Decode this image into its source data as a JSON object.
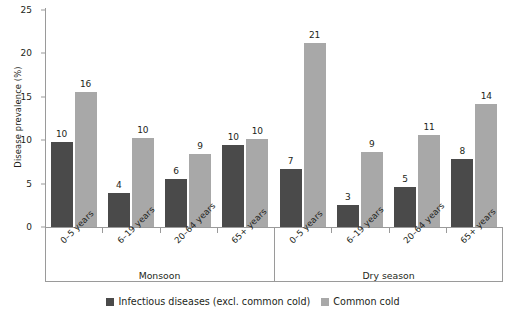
{
  "chart_data": {
    "type": "bar",
    "title": "",
    "xlabel": "",
    "ylabel": "Disease prevalence (%)",
    "ylim": [
      0,
      25
    ],
    "yticks": [
      0,
      5,
      10,
      15,
      20,
      25
    ],
    "grid": false,
    "legend_position": "bottom",
    "group_labels": [
      "Monsoon",
      "Dry season"
    ],
    "categories": [
      "0–5 years",
      "6–19 years",
      "20–64 years",
      "65+ years",
      "0–5 years",
      "6–19 years",
      "20–64 years",
      "65+ years"
    ],
    "series": [
      {
        "name": "Infectious diseases (excl. common cold)",
        "color": "#4a4a4a",
        "values": [
          10,
          4,
          6,
          10,
          7,
          3,
          5,
          8
        ],
        "plotted": [
          9.8,
          3.9,
          5.5,
          9.5,
          6.7,
          2.5,
          4.6,
          7.8
        ]
      },
      {
        "name": "Common cold",
        "color": "#a8a8a8",
        "values": [
          16,
          10,
          9,
          10,
          21,
          9,
          11,
          14
        ],
        "plotted": [
          15.5,
          10.2,
          8.4,
          10.1,
          21.2,
          8.6,
          10.6,
          14.2
        ]
      }
    ]
  },
  "legend": {
    "items": [
      {
        "label": "Infectious diseases (excl. common cold)",
        "color": "#4a4a4a"
      },
      {
        "label": "Common cold",
        "color": "#a8a8a8"
      }
    ]
  }
}
